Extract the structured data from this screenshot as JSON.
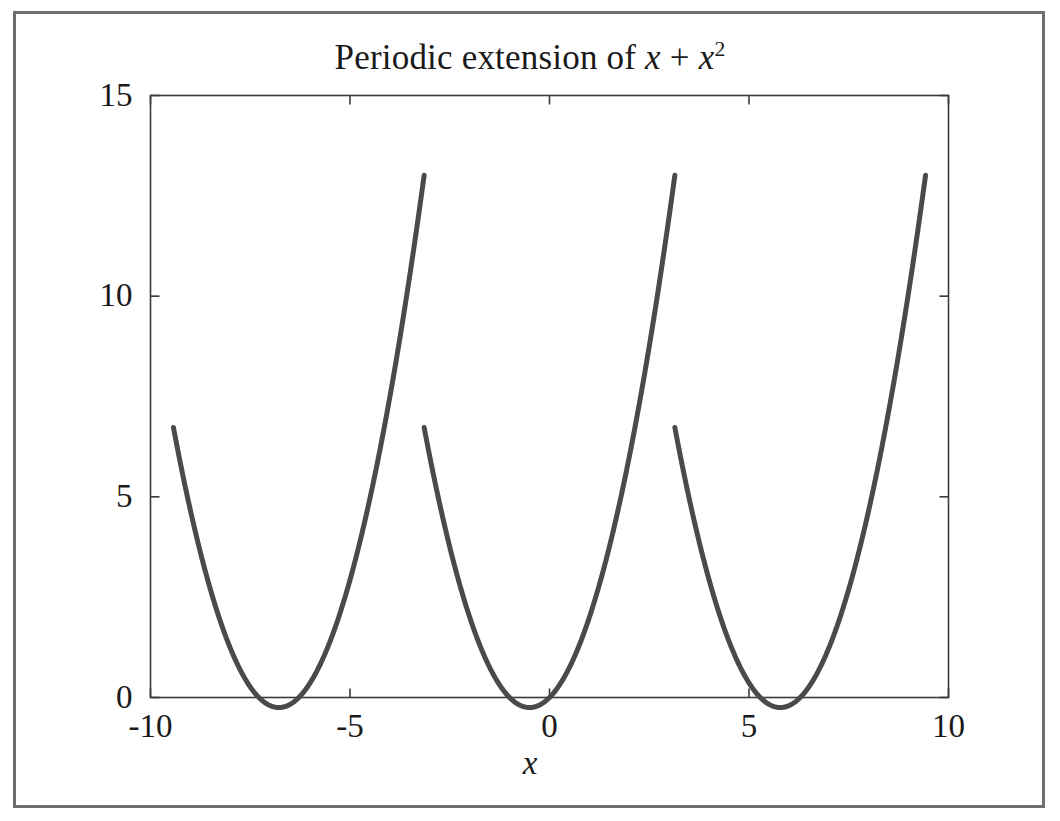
{
  "figure": {
    "background": "#ffffff",
    "frame_color": "#6e6e72",
    "curve_color": "#4a4a4a",
    "axis_color": "#3a3a3a",
    "title_parts": {
      "prefix": "Periodic extension of ",
      "var1": "x",
      "plus": " + ",
      "var2": "x",
      "exponent": "2"
    },
    "title_plain": "Periodic extension of x + x^2",
    "xlabel": "x",
    "ylabel": ""
  },
  "chart_data": {
    "type": "line",
    "xlabel": "x",
    "ylabel": "",
    "xlim": [
      -10,
      10
    ],
    "ylim": [
      0,
      15
    ],
    "xticks": [
      -10,
      -5,
      0,
      5,
      10
    ],
    "xtick_labels": [
      "-10",
      "-5",
      "0",
      "5",
      "10"
    ],
    "yticks": [
      0,
      5,
      10,
      15
    ],
    "ytick_labels": [
      "0",
      "5",
      "10",
      "15"
    ],
    "grid": false,
    "legend": null,
    "function": "f(x) = t + t^2 where t = ((x + pi) mod 2pi) - pi",
    "period": 6.2832,
    "line_width": 5,
    "series": [
      {
        "name": "periodic extension of x + x^2",
        "color": "#4a4a4a",
        "segments": [
          {
            "note": "left branch, t from -pi to pi, clipped at plot left edge x=-10",
            "x_start": -9.4248,
            "x_end": -3.1416,
            "y_start": 6.8,
            "y_min": -0.25,
            "x_at_min": -6.7832,
            "y_end": 13.0
          },
          {
            "note": "middle branch",
            "x_start": -3.1416,
            "x_end": 3.1416,
            "y_start": 6.8,
            "y_min": -0.25,
            "x_at_min": -0.5,
            "y_end": 13.0
          },
          {
            "note": "right branch, clipped at plot right edge x=10",
            "x_start": 3.1416,
            "x_end": 9.4248,
            "y_start": 6.8,
            "y_min": -0.25,
            "x_at_min": 5.7832,
            "y_end": 13.0
          }
        ]
      }
    ]
  },
  "axes": {
    "ticks_x": [
      {
        "value": -10,
        "label": "-10"
      },
      {
        "value": -5,
        "label": "-5"
      },
      {
        "value": 0,
        "label": "0"
      },
      {
        "value": 5,
        "label": "5"
      },
      {
        "value": 10,
        "label": "10"
      }
    ],
    "ticks_y": [
      {
        "value": 0,
        "label": "0"
      },
      {
        "value": 5,
        "label": "5"
      },
      {
        "value": 10,
        "label": "10"
      },
      {
        "value": 15,
        "label": "15"
      }
    ]
  }
}
